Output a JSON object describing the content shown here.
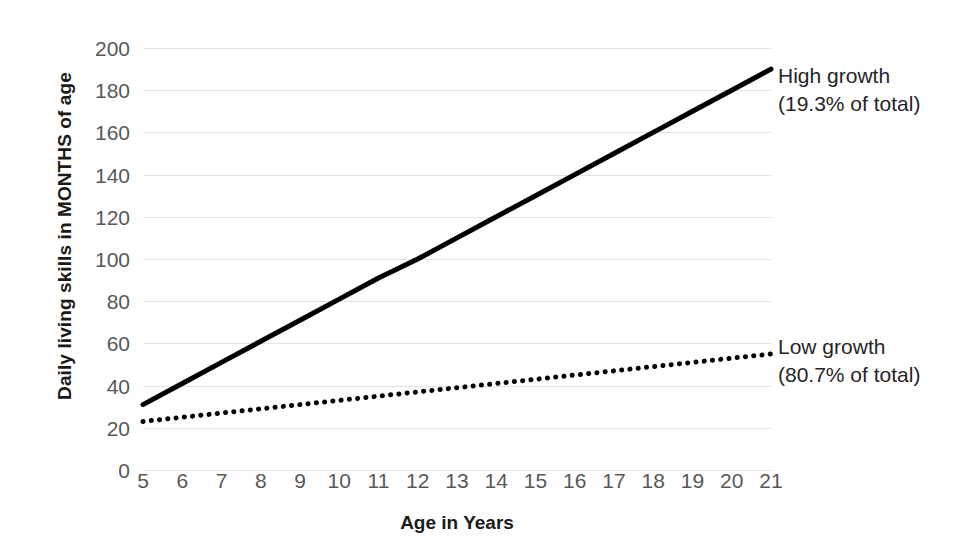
{
  "chart_data": {
    "type": "line",
    "title": "",
    "xlabel": "Age in Years",
    "ylabel": "Daily living skills in MONTHS of age",
    "xlim": [
      5,
      21
    ],
    "ylim": [
      0,
      200
    ],
    "grid": true,
    "legend_position": "right-inline-annotations",
    "x": [
      5,
      6,
      7,
      8,
      9,
      10,
      11,
      12,
      13,
      14,
      15,
      16,
      17,
      18,
      19,
      20,
      21
    ],
    "xtick_labels": [
      "5",
      "6",
      "7",
      "8",
      "9",
      "10",
      "11",
      "12",
      "13",
      "14",
      "15",
      "16",
      "17",
      "18",
      "19",
      "20",
      "21"
    ],
    "ytick_labels": [
      "0",
      "20",
      "40",
      "60",
      "80",
      "100",
      "120",
      "140",
      "160",
      "180",
      "200"
    ],
    "yticks": [
      0,
      20,
      40,
      60,
      80,
      100,
      120,
      140,
      160,
      180,
      200
    ],
    "series": [
      {
        "name": "High growth",
        "style": "solid",
        "color": "#000000",
        "width": 5,
        "annotation_line1": "High growth",
        "annotation_line2": "(19.3% of total)",
        "values": [
          31,
          41,
          51,
          61,
          71,
          81,
          91,
          100,
          110,
          120,
          130,
          140,
          150,
          160,
          170,
          180,
          190
        ]
      },
      {
        "name": "Low growth",
        "style": "dotted",
        "color": "#000000",
        "width": 5,
        "annotation_line1": "Low growth",
        "annotation_line2": "(80.7% of total)",
        "values": [
          23,
          25,
          27,
          29,
          31,
          33,
          35,
          37,
          39,
          41,
          43,
          45,
          47,
          49,
          51,
          53,
          55
        ]
      }
    ],
    "colors": {
      "grid": "#e3e3e3",
      "tick_label": "#585858",
      "axis_title": "#1a1a1a",
      "annotation": "#262626",
      "background": "#ffffff"
    }
  },
  "axes": {
    "y_title": "Daily living skills in MONTHS of age",
    "x_title": "Age in Years"
  },
  "annotations": {
    "high": {
      "line1": "High growth",
      "line2": "(19.3% of total)"
    },
    "low": {
      "line1": "Low growth",
      "line2": "(80.7% of total)"
    }
  }
}
